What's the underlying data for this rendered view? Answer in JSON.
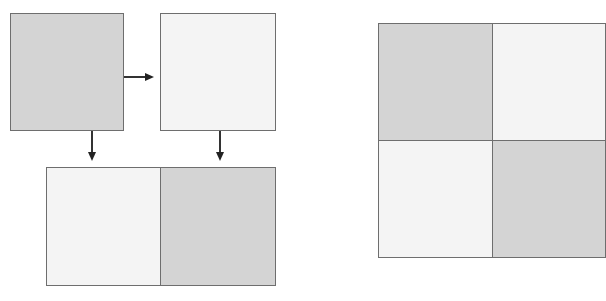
{
  "diagram": {
    "colors": {
      "dark_fill": "#d4d4d4",
      "light_fill": "#f4f4f4",
      "border": "#6e6e6e",
      "arrow": "#222222"
    },
    "left_group": {
      "top_left_box": {
        "fill": "dark"
      },
      "top_right_box": {
        "fill": "light"
      },
      "arrow_horizontal": {
        "from": "top_left_box",
        "to": "top_right_box",
        "direction": "right"
      },
      "arrow_down_left": {
        "from": "top_left_box",
        "to": "bottom_row_cell_1",
        "direction": "down"
      },
      "arrow_down_right": {
        "from": "top_right_box",
        "to": "bottom_row_cell_2",
        "direction": "down"
      },
      "bottom_row": {
        "cells": [
          {
            "fill": "light"
          },
          {
            "fill": "dark"
          }
        ]
      }
    },
    "right_group": {
      "grid": {
        "rows": 2,
        "cols": 2,
        "cells": [
          {
            "fill": "dark"
          },
          {
            "fill": "light"
          },
          {
            "fill": "light"
          },
          {
            "fill": "dark"
          }
        ]
      }
    }
  }
}
